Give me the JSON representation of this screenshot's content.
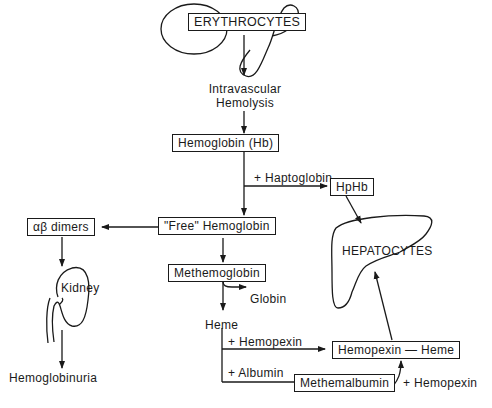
{
  "diagram": {
    "nodes": {
      "erythrocytes": "ERYTHROCYTES",
      "intravascular_hemolysis_line1": "Intravascular",
      "intravascular_hemolysis_line2": "Hemolysis",
      "hemoglobin": "Hemoglobin (Hb)",
      "hphb": "HpHb",
      "free_hemoglobin": "\"Free\" Hemoglobin",
      "ab_dimers": "αβ dimers",
      "kidney": "Kidney",
      "hemoglobinuria": "Hemoglobinuria",
      "methemoglobin": "Methemoglobin",
      "globin": "Globin",
      "heme": "Heme",
      "hepatocytes": "HEPATOCYTES",
      "hemopexin_heme": "Hemopexin — Heme",
      "methemalbumin": "Methemalbumin"
    },
    "edge_labels": {
      "plus_haptoglobin": "+ Haptoglobin",
      "plus_hemopexin": "+ Hemopexin",
      "plus_albumin": "+ Albumin",
      "plus_hemopexin_2": "+ Hemopexin"
    },
    "colors": {
      "ink": "#1a1a1a",
      "background": "#ffffff"
    }
  }
}
